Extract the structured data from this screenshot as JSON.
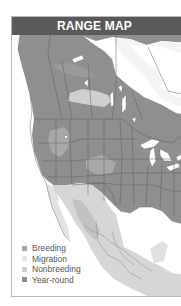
{
  "header": {
    "title": "RANGE MAP"
  },
  "colors": {
    "header_bg": "#5a5a5a",
    "year_round": "#8f8f8f",
    "breeding": "#a6a6a6",
    "migration": "#e6e6e6",
    "nonbreeding": "#cfcfcf",
    "water": "#ffffff",
    "land_outside": "#ededed",
    "borders": "#5e5e5e"
  },
  "legend": {
    "items": [
      {
        "label": "Breeding",
        "color": "#a6a6a6"
      },
      {
        "label": "Migration",
        "color": "#e6e6e6"
      },
      {
        "label": "Nonbreeding",
        "color": "#cfcfcf"
      },
      {
        "label": "Year-round",
        "color": "#8f8f8f"
      }
    ]
  }
}
